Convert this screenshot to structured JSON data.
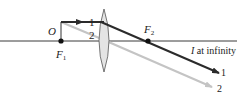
{
  "diagram": {
    "type": "optics-ray-diagram",
    "labels": {
      "object": "O",
      "focal_point_1_main": "F",
      "focal_point_1_sub": "1",
      "focal_point_2_main": "F",
      "focal_point_2_sub": "2",
      "image_main": "I",
      "image_rest": " at infinity",
      "ray1_start": "1",
      "ray1_end": "1",
      "ray2_start": "2",
      "ray2_end": "2"
    },
    "colors": {
      "axis": "#3a3a3a",
      "ray1": "#2b2b2b",
      "ray2": "#c4c4c4",
      "lens_fill": "#e4e4e4",
      "lens_stroke": "#555555",
      "point": "#111111"
    }
  }
}
